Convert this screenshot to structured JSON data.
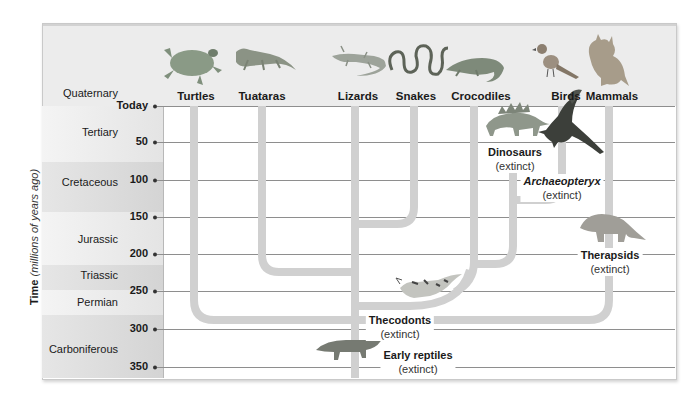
{
  "axis": {
    "title_bold": "Time",
    "title_italic": "(millions of years ago)"
  },
  "eras": [
    {
      "label": "Quaternary",
      "top": 23,
      "height": 83,
      "shade": "#ececec"
    },
    {
      "label": "Tertiary",
      "top": 106,
      "height": 56,
      "shade": "#ececec"
    },
    {
      "label": "Cretaceous",
      "top": 162,
      "height": 50,
      "shade": "#d8d8d8"
    },
    {
      "label": "Jurassic",
      "top": 212,
      "height": 53,
      "shade": "#ececec"
    },
    {
      "label": "Triassic",
      "top": 265,
      "height": 25,
      "shade": "#d8d8d8"
    },
    {
      "label": "Permian",
      "top": 290,
      "height": 25,
      "shade": "#ececec"
    },
    {
      "label": "Carboniferous",
      "top": 315,
      "height": 63,
      "shade": "#d8d8d8"
    }
  ],
  "era_labels": [
    "Quaternary",
    "Tertiary",
    "Cretaceous",
    "Jurassic",
    "Triassic",
    "Permian",
    "Carboniferous"
  ],
  "ticks": [
    {
      "label": "Today",
      "y": 106
    },
    {
      "label": "50",
      "y": 142
    },
    {
      "label": "100",
      "y": 180
    },
    {
      "label": "150",
      "y": 217
    },
    {
      "label": "200",
      "y": 254
    },
    {
      "label": "250",
      "y": 291
    },
    {
      "label": "300",
      "y": 329
    },
    {
      "label": "350",
      "y": 367
    }
  ],
  "tick_labels": [
    "Today",
    "50",
    "100",
    "150",
    "200",
    "250",
    "300",
    "350"
  ],
  "taxa": [
    {
      "label": "Turtles",
      "x": 194
    },
    {
      "label": "Tuataras",
      "x": 262
    },
    {
      "label": "Lizards",
      "x": 355
    },
    {
      "label": "Snakes",
      "x": 414
    },
    {
      "label": "Crocodiles",
      "x": 474
    },
    {
      "label": "Birds",
      "x": 562
    },
    {
      "label": "Mammals",
      "x": 609
    }
  ],
  "taxa_labels": [
    "Turtles",
    "Tuataras",
    "Lizards",
    "Snakes",
    "Crocodiles",
    "Birds",
    "Mammals"
  ],
  "extinct_groups": [
    {
      "name": "Dinosaurs",
      "status": "(extinct)",
      "italic": false
    },
    {
      "name": "Archaeopteryx",
      "status": "(extinct)",
      "italic": true
    },
    {
      "name": "Therapsids",
      "status": "(extinct)",
      "italic": false
    },
    {
      "name": "Thecodonts",
      "status": "(extinct)",
      "italic": false
    },
    {
      "name": "Early reptiles",
      "status": "(extinct)",
      "italic": false
    }
  ],
  "icons": {
    "turtles": "turtle-icon",
    "tuataras": "tuatara-icon",
    "lizards": "lizard-icon",
    "snakes": "snake-icon",
    "crocodiles": "crocodile-icon",
    "birds": "bird-icon",
    "mammals": "lynx-icon",
    "dinosaurs": "stegosaurus-icon",
    "archaeopteryx": "archaeopteryx-icon",
    "therapsids": "therapsid-icon",
    "thecodonts": "thecodont-icon",
    "early_reptiles": "early-reptile-icon"
  },
  "colors": {
    "branch": "#d0d0d0",
    "gridline": "#8e8e8e",
    "header": "#ececec",
    "band_dark": "#d8d8d8",
    "band_light": "#ececec"
  }
}
